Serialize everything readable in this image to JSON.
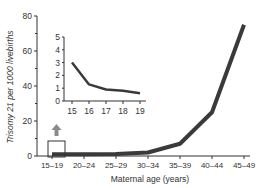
{
  "chart_data": [
    {
      "type": "line",
      "title": "",
      "xlabel": "Maternal age (years)",
      "ylabel": "Trisomy 21 per 1000 livebirths",
      "categories": [
        "15–19",
        "20–24",
        "25–29",
        "30–34",
        "35–39",
        "40–44",
        "45–49"
      ],
      "values": [
        1,
        1,
        1.2,
        2,
        7,
        25,
        75
      ],
      "ylim": [
        0,
        80
      ],
      "yticks": [
        0,
        20,
        40,
        60,
        80
      ],
      "grid": false,
      "legend": null,
      "annotations": [
        "Box and arrow at 15–19 indicating zoomed inset"
      ]
    },
    {
      "type": "line",
      "title": "",
      "xlabel": "",
      "ylabel": "",
      "categories": [
        "15",
        "16",
        "17",
        "18",
        "19"
      ],
      "values": [
        3.0,
        1.3,
        0.9,
        0.8,
        0.6
      ],
      "ylim": [
        0,
        5
      ],
      "yticks": [
        0,
        1,
        2,
        3,
        4,
        5
      ],
      "grid": false,
      "legend": null
    }
  ],
  "colors": {
    "line": "#3a3a3a",
    "axis": "#333333",
    "arrow": "#8a8a8a"
  }
}
